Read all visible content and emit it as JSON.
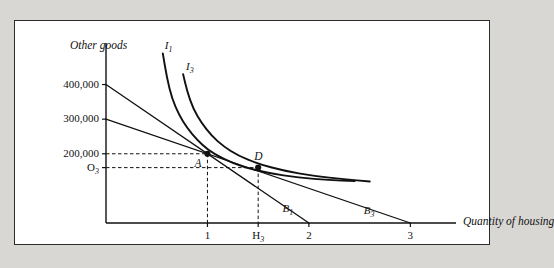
{
  "figure": {
    "background_color": "#d9d7d4",
    "panel_color": "#ffffff",
    "border_color": "#2b2b2b",
    "ink_color": "#111111"
  },
  "chart_data": {
    "type": "line",
    "title": "",
    "xlabel": "Quantity of housing",
    "ylabel": "Other goods",
    "xlim": [
      0,
      3.45
    ],
    "ylim": [
      0,
      520000
    ],
    "grid": false,
    "legend": "inline-curve-labels",
    "x_ticks": [
      {
        "value": 1,
        "label": "1"
      },
      {
        "value": 1.5,
        "label": "H",
        "sub": "3"
      },
      {
        "value": 2,
        "label": "2"
      },
      {
        "value": 3,
        "label": "3"
      }
    ],
    "y_ticks": [
      {
        "value": 400000,
        "label": "400,000"
      },
      {
        "value": 300000,
        "label": "300,000"
      },
      {
        "value": 200000,
        "label": "200,000"
      },
      {
        "value": 160000,
        "label": "O",
        "sub": "3"
      }
    ],
    "series": [
      {
        "name": "B1",
        "label": "B",
        "sub": "1",
        "kind": "budget-line",
        "style": "solid",
        "points": [
          [
            0,
            400000
          ],
          [
            2.0,
            0
          ]
        ]
      },
      {
        "name": "B3",
        "label": "B",
        "sub": "3",
        "kind": "budget-line",
        "style": "solid",
        "points": [
          [
            0,
            300000
          ],
          [
            3.0,
            0
          ]
        ]
      },
      {
        "name": "I1",
        "label": "I",
        "sub": "1",
        "kind": "indifference-curve",
        "style": "solid",
        "points": [
          [
            0.56,
            490000
          ],
          [
            0.6,
            420000
          ],
          [
            0.65,
            360000
          ],
          [
            0.72,
            312000
          ],
          [
            0.8,
            274000
          ],
          [
            0.9,
            240000
          ],
          [
            1.0,
            212000
          ],
          [
            1.15,
            186000
          ],
          [
            1.35,
            162000
          ],
          [
            1.6,
            144000
          ],
          [
            1.9,
            131000
          ],
          [
            2.2,
            124000
          ],
          [
            2.45,
            121000
          ]
        ]
      },
      {
        "name": "I3",
        "label": "I",
        "sub": "3",
        "kind": "indifference-curve",
        "style": "solid",
        "points": [
          [
            0.76,
            430000
          ],
          [
            0.8,
            380000
          ],
          [
            0.86,
            330000
          ],
          [
            0.94,
            290000
          ],
          [
            1.04,
            252000
          ],
          [
            1.16,
            221000
          ],
          [
            1.3,
            195000
          ],
          [
            1.5,
            171000
          ],
          [
            1.75,
            151000
          ],
          [
            2.05,
            136000
          ],
          [
            2.35,
            126000
          ],
          [
            2.6,
            120000
          ]
        ]
      }
    ],
    "points": [
      {
        "name": "A",
        "label": "A",
        "x": 1.0,
        "y": 200000,
        "marker": "filled-dot"
      },
      {
        "name": "D",
        "label": "D",
        "x": 1.5,
        "y": 160000,
        "marker": "filled-dot"
      }
    ],
    "guides": [
      {
        "name": "y-200000-to-A",
        "type": "dashed-horizontal",
        "from": [
          0,
          200000
        ],
        "to": [
          1.0,
          200000
        ]
      },
      {
        "name": "A-to-x-1",
        "type": "dashed-vertical",
        "from": [
          1.0,
          200000
        ],
        "to": [
          1.0,
          0
        ]
      },
      {
        "name": "y-O3-to-D",
        "type": "dashed-horizontal",
        "from": [
          0,
          160000
        ],
        "to": [
          1.5,
          160000
        ]
      },
      {
        "name": "D-to-x-H3",
        "type": "dashed-vertical",
        "from": [
          1.5,
          160000
        ],
        "to": [
          1.5,
          0
        ]
      }
    ]
  }
}
